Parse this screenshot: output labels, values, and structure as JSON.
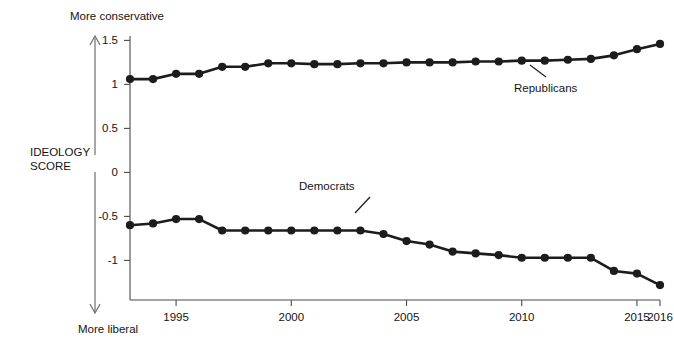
{
  "chart_data": {
    "type": "line",
    "title": "",
    "subtitle": "",
    "xlabel": "",
    "ylabel": "IDEOLOGY SCORE",
    "ylabel_line1": "IDEOLOGY",
    "ylabel_line2": "SCORE",
    "axis_top_caption": "More conservative",
    "axis_bottom_caption": "More liberal",
    "grid": false,
    "legend_position": "inline-annotations",
    "xlim": [
      1993,
      2016
    ],
    "ylim": [
      -1.45,
      1.55
    ],
    "yticks": [
      1.5,
      1,
      0.5,
      0,
      -0.5,
      -1
    ],
    "ytick_labels": [
      "1.5",
      "1",
      "0.5",
      "0",
      "-0.5",
      "-1"
    ],
    "xticks": [
      1995,
      2000,
      2005,
      2010,
      2015,
      2016
    ],
    "xtick_labels": [
      "1995",
      "2000",
      "2005",
      "2010",
      "2015",
      "2016"
    ],
    "x": [
      1993,
      1994,
      1995,
      1996,
      1997,
      1998,
      1999,
      2000,
      2001,
      2002,
      2003,
      2004,
      2005,
      2006,
      2007,
      2008,
      2009,
      2010,
      2011,
      2012,
      2013,
      2014,
      2015,
      2016
    ],
    "series": [
      {
        "name": "Republicans",
        "label": "Republicans",
        "color": "#1c1c1c",
        "values": [
          1.06,
          1.06,
          1.12,
          1.12,
          1.2,
          1.2,
          1.24,
          1.24,
          1.23,
          1.23,
          1.24,
          1.24,
          1.25,
          1.25,
          1.25,
          1.26,
          1.26,
          1.27,
          1.27,
          1.28,
          1.29,
          1.33,
          1.4,
          1.46
        ]
      },
      {
        "name": "Democrats",
        "label": "Democrats",
        "color": "#1c1c1c",
        "values": [
          -0.6,
          -0.58,
          -0.53,
          -0.53,
          -0.66,
          -0.66,
          -0.66,
          -0.66,
          -0.66,
          -0.66,
          -0.66,
          -0.7,
          -0.78,
          -0.82,
          -0.9,
          -0.92,
          -0.94,
          -0.97,
          -0.97,
          -0.97,
          -0.97,
          -1.12,
          -1.15,
          -1.28
        ]
      }
    ],
    "annotations": [
      {
        "name": "Republicans",
        "text": "Republicans",
        "x": 2013,
        "y": 1.29
      },
      {
        "name": "Democrats",
        "text": "Democrats",
        "x": 2004,
        "y": -0.7
      }
    ]
  }
}
